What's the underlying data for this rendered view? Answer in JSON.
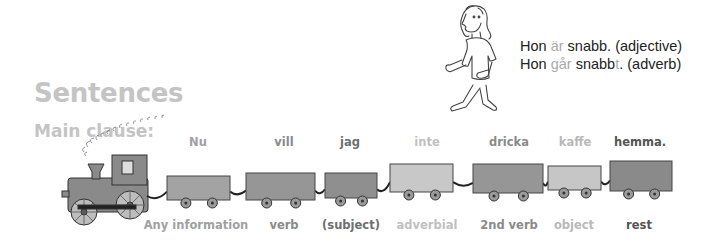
{
  "heading": {
    "title": "Sentences",
    "subtitle": "Main clause:"
  },
  "examples": [
    {
      "pre": "Hon ",
      "highlight": "är",
      "mid": " snabb",
      "suffix": "",
      "post": ". (adjective)"
    },
    {
      "pre": "Hon ",
      "highlight": "går",
      "mid": " snabb",
      "suffix": "t",
      "post": ". (adverb)"
    }
  ],
  "colors": {
    "heading": "#c4c4c4",
    "wagon_dark": "#8f8f8f",
    "wagon_mid": "#a3a3a3",
    "wagon_light": "#c8c8c8",
    "text_dark": "#555555",
    "text_mid": "#8a8a8a",
    "text_light": "#b8b8b8"
  },
  "train": {
    "wagons": [
      {
        "word": "Nu",
        "label": "Any information",
        "word_color": "#a0a0a0",
        "label_color": "#a0a0a0",
        "fill": "#a3a3a3"
      },
      {
        "word": "vill",
        "label": "verb",
        "word_color": "#8a8a8a",
        "label_color": "#8a8a8a",
        "fill": "#969696"
      },
      {
        "word": "jag",
        "label": "(subject)",
        "word_color": "#6e6e6e",
        "label_color": "#6e6e6e",
        "fill": "#8f8f8f"
      },
      {
        "word": "inte",
        "label": "adverbial",
        "word_color": "#c0c0c0",
        "label_color": "#c0c0c0",
        "fill": "#c8c8c8"
      },
      {
        "word": "dricka",
        "label": "2nd verb",
        "word_color": "#8a8a8a",
        "label_color": "#8a8a8a",
        "fill": "#969696"
      },
      {
        "word": "kaffe",
        "label": "object",
        "word_color": "#b8b8b8",
        "label_color": "#b8b8b8",
        "fill": "#c6c6c6"
      },
      {
        "word": "hemma.",
        "label": "rest",
        "word_color": "#555555",
        "label_color": "#555555",
        "fill": "#8a8a8a"
      }
    ]
  }
}
